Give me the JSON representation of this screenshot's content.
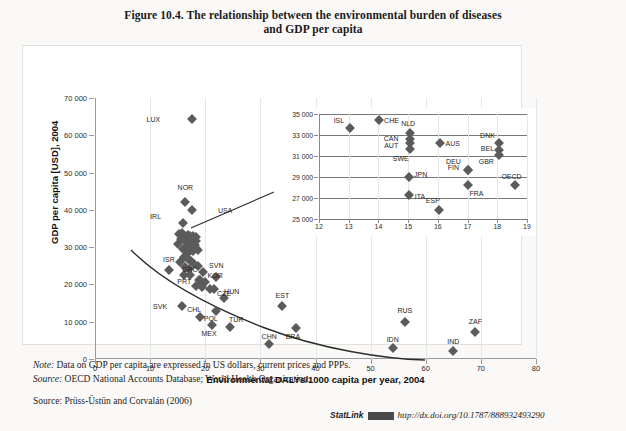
{
  "figure": {
    "title_line1": "Figure 10.4. The relationship between the environmental burden of diseases",
    "title_line2": "and GDP per capita"
  },
  "notes": {
    "note_label": "Note:",
    "note_text": " Data on GDP per capita are expressed in US dollars, current prices and PPPs.",
    "source_label": "Source:",
    "source_text": " OECD National Accounts Database; World Health Organization.",
    "source2_label": "Source:",
    "source2_text": " Prüss-Üstün and Corvalán (2006)"
  },
  "statlink": {
    "word": "StatLink",
    "url": "http://dx.doi.org/10.1787/888932493290"
  },
  "chart_data": [
    {
      "type": "scatter",
      "name": "main",
      "title": "The relationship between the environmental burden of diseases and GDP per capita",
      "xlabel": "Environmental DALYs/1000 capita per year, 2004",
      "ylabel": "GDP per capita [USD], 2004",
      "xlim": [
        0,
        80
      ],
      "ylim": [
        0,
        70000
      ],
      "xticks": [
        0,
        10,
        20,
        30,
        40,
        50,
        60,
        70,
        80
      ],
      "yticks": [
        0,
        10000,
        20000,
        30000,
        40000,
        50000,
        60000,
        70000
      ],
      "ytick_labels": [
        "0",
        "10 000",
        "20 000",
        "30 000",
        "40 000",
        "50 000",
        "60 000",
        "70 000"
      ],
      "grid": "vertical",
      "legend": "none",
      "marker": "diamond",
      "marker_color": "#5b5b5b",
      "trendline": true,
      "points": [
        {
          "label": "LUX",
          "x": 17.6,
          "y": 64500,
          "lx": -7.0,
          "ly": 0
        },
        {
          "label": "NOR",
          "x": 16.4,
          "y": 42000,
          "lx": 0,
          "ly": 4200
        },
        {
          "label": "USA",
          "x": 17.6,
          "y": 40000,
          "lx": 6.0,
          "ly": 0
        },
        {
          "label": "IRL",
          "x": 16.0,
          "y": 36400,
          "lx": -5.0,
          "ly": 2000
        },
        {
          "label": "ISR",
          "x": 13.4,
          "y": 23800,
          "lx": 0,
          "ly": 3000
        },
        {
          "label": "GRC",
          "x": 17.2,
          "y": 22400,
          "lx": 0,
          "ly": 1700
        },
        {
          "label": "KOR",
          "x": 19.0,
          "y": 21200,
          "lx": 2.8,
          "ly": 1200
        },
        {
          "label": "SVN",
          "x": 22.0,
          "y": 22100,
          "lx": 0,
          "ly": 3000
        },
        {
          "label": "PRT",
          "x": 18.4,
          "y": 19600,
          "lx": -2.2,
          "ly": 1400
        },
        {
          "label": "CZE",
          "x": 20.8,
          "y": 18700,
          "lx": 2.6,
          "ly": -1100
        },
        {
          "label": "HUN",
          "x": 23.4,
          "y": 16300,
          "lx": 1.4,
          "ly": 2000
        },
        {
          "label": "SVK",
          "x": 15.8,
          "y": 14200,
          "lx": -4.0,
          "ly": 0
        },
        {
          "label": "POL",
          "x": 22.0,
          "y": 13000,
          "lx": -1.0,
          "ly": -1900
        },
        {
          "label": "EST",
          "x": 34.0,
          "y": 14100,
          "lx": 0,
          "ly": 3000
        },
        {
          "label": "CHL",
          "x": 19.0,
          "y": 11200,
          "lx": -1.0,
          "ly": 2100
        },
        {
          "label": "TUR",
          "x": 24.4,
          "y": 8600,
          "lx": 1.2,
          "ly": 2100
        },
        {
          "label": "MEX",
          "x": 21.2,
          "y": 9000,
          "lx": -0.5,
          "ly": -2000
        },
        {
          "label": "BRA",
          "x": 36.4,
          "y": 8400,
          "lx": -0.5,
          "ly": -2200
        },
        {
          "label": "CHN",
          "x": 31.6,
          "y": 4100,
          "lx": 0,
          "ly": 2200
        },
        {
          "label": "RUS",
          "x": 56.2,
          "y": 10000,
          "lx": 0,
          "ly": 3200
        },
        {
          "label": "IDN",
          "x": 54.0,
          "y": 2900,
          "lx": 0,
          "ly": 2400
        },
        {
          "label": "IND",
          "x": 65.0,
          "y": 2100,
          "lx": 0,
          "ly": 2600
        },
        {
          "label": "ZAF",
          "x": 69.0,
          "y": 7200,
          "lx": 0,
          "ly": 3000
        }
      ],
      "cluster_points": [
        {
          "x": 15.2,
          "y": 33400
        },
        {
          "x": 15.8,
          "y": 33700
        },
        {
          "x": 16.3,
          "y": 33100
        },
        {
          "x": 16.8,
          "y": 33300
        },
        {
          "x": 17.3,
          "y": 32900
        },
        {
          "x": 17.8,
          "y": 33100
        },
        {
          "x": 18.3,
          "y": 32600
        },
        {
          "x": 15.6,
          "y": 32200
        },
        {
          "x": 16.2,
          "y": 31900
        },
        {
          "x": 16.7,
          "y": 31500
        },
        {
          "x": 17.2,
          "y": 31800
        },
        {
          "x": 17.9,
          "y": 31300
        },
        {
          "x": 18.4,
          "y": 31600
        },
        {
          "x": 16.9,
          "y": 30400
        },
        {
          "x": 17.5,
          "y": 30000
        },
        {
          "x": 18.1,
          "y": 30600
        },
        {
          "x": 15.9,
          "y": 29500
        },
        {
          "x": 16.5,
          "y": 29000
        },
        {
          "x": 17.1,
          "y": 28600
        },
        {
          "x": 17.7,
          "y": 28900
        },
        {
          "x": 18.6,
          "y": 29300
        },
        {
          "x": 16.1,
          "y": 27400
        },
        {
          "x": 16.8,
          "y": 26800
        },
        {
          "x": 17.4,
          "y": 26300
        },
        {
          "x": 15.4,
          "y": 25900
        },
        {
          "x": 18.0,
          "y": 25400
        },
        {
          "x": 16.4,
          "y": 24600
        },
        {
          "x": 17.0,
          "y": 24100
        },
        {
          "x": 18.7,
          "y": 24900
        },
        {
          "x": 19.6,
          "y": 23200
        },
        {
          "x": 18.9,
          "y": 21300
        },
        {
          "x": 20.0,
          "y": 20600
        },
        {
          "x": 19.4,
          "y": 19300
        },
        {
          "x": 21.5,
          "y": 18800
        },
        {
          "x": 16.2,
          "y": 22600
        },
        {
          "x": 15.0,
          "y": 30900
        }
      ],
      "trend_path": "M 36,152 C 70,186 118,210 170,230 C 225,251 290,261 330,262"
    },
    {
      "type": "scatter",
      "name": "inset",
      "xlim": [
        12,
        19
      ],
      "ylim": [
        25000,
        35000
      ],
      "xticks": [
        12,
        13,
        14,
        15,
        16,
        17,
        18,
        19
      ],
      "yticks": [
        25000,
        27000,
        29000,
        31000,
        33000,
        35000
      ],
      "ytick_labels": [
        "25 000",
        "27 000",
        "29 000",
        "31 000",
        "33 000",
        "35 000"
      ],
      "grid": "horizontal",
      "marker": "diamond",
      "marker_color": "#5b5b5b",
      "points": [
        {
          "label": "ISL",
          "x": 13.05,
          "y": 33700,
          "lx": -0.38,
          "ly": 700
        },
        {
          "label": "CHE",
          "x": 14.02,
          "y": 34400,
          "lx": 0.42,
          "ly": 0
        },
        {
          "label": "NLD",
          "x": 15.05,
          "y": 33200,
          "lx": -0.05,
          "ly": 900
        },
        {
          "label": "CAN",
          "x": 15.05,
          "y": 32600,
          "lx": -0.62,
          "ly": 150
        },
        {
          "label": "AUT",
          "x": 15.05,
          "y": 32200,
          "lx": -0.62,
          "ly": -150
        },
        {
          "label": "SWE",
          "x": 15.05,
          "y": 31700,
          "lx": -0.3,
          "ly": -900
        },
        {
          "label": "AUS",
          "x": 16.08,
          "y": 32250,
          "lx": 0.42,
          "ly": 0
        },
        {
          "label": "DNK",
          "x": 18.05,
          "y": 32200,
          "lx": -0.38,
          "ly": 800
        },
        {
          "label": "BEL",
          "x": 18.05,
          "y": 31600,
          "lx": -0.38,
          "ly": 150
        },
        {
          "label": "GBR",
          "x": 18.05,
          "y": 31100,
          "lx": -0.42,
          "ly": -550
        },
        {
          "label": "DEU",
          "x": 17.02,
          "y": 29700,
          "lx": -0.5,
          "ly": 800
        },
        {
          "label": "FIN",
          "x": 17.02,
          "y": 29700,
          "lx": -0.5,
          "ly": 300
        },
        {
          "label": "JPN",
          "x": 15.02,
          "y": 29000,
          "lx": 0.4,
          "ly": 250
        },
        {
          "label": "OECD",
          "x": 18.58,
          "y": 28200,
          "lx": -0.1,
          "ly": 900
        },
        {
          "label": "FRA",
          "x": 17.02,
          "y": 28200,
          "lx": 0.28,
          "ly": -750
        },
        {
          "label": "ITA",
          "x": 15.02,
          "y": 27300,
          "lx": 0.38,
          "ly": -120
        },
        {
          "label": "ESP",
          "x": 16.05,
          "y": 25900,
          "lx": -0.22,
          "ly": 900
        }
      ]
    }
  ]
}
